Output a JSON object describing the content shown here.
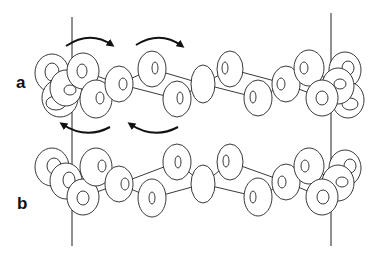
{
  "figure": {
    "panels": [
      {
        "label": "a",
        "label_pos": [
          16,
          74
        ],
        "rotation_arrows": [
          {
            "from": [
              66,
              46
            ],
            "ctrl": [
              90,
              30
            ],
            "to": [
              112,
              45
            ],
            "direction": "clockwise-right"
          },
          {
            "from": [
              136,
              45
            ],
            "ctrl": [
              160,
              30
            ],
            "to": [
              182,
              46
            ],
            "direction": "clockwise-right"
          },
          {
            "from": [
              110,
              127
            ],
            "ctrl": [
              86,
              140
            ],
            "to": [
              62,
              124
            ],
            "direction": "counter-left"
          },
          {
            "from": [
              178,
              127
            ],
            "ctrl": [
              154,
              140
            ],
            "to": [
              130,
              124
            ],
            "direction": "counter-left"
          }
        ],
        "rings": [
          {
            "cx": 52,
            "cy": 73,
            "rx": 17,
            "ry": 19,
            "hx": 52,
            "hy": 72,
            "hrx": 7,
            "hry": 9
          },
          {
            "cx": 60,
            "cy": 98,
            "rx": 18,
            "ry": 19,
            "hx": 56,
            "hy": 103,
            "hrx": 10,
            "hry": 7
          },
          {
            "cx": 66,
            "cy": 88,
            "rx": 16,
            "ry": 18,
            "hx": 70,
            "hy": 90,
            "hrx": 6,
            "hry": 5
          },
          {
            "cx": 83,
            "cy": 71,
            "rx": 16,
            "ry": 18,
            "hx": 82,
            "hy": 71,
            "hrx": 5,
            "hry": 7
          },
          {
            "cx": 96,
            "cy": 99,
            "rx": 16,
            "ry": 19,
            "hx": 100,
            "hy": 98,
            "hrx": 4,
            "hry": 6
          },
          {
            "cx": 119,
            "cy": 84,
            "rx": 14,
            "ry": 18,
            "hx": 123,
            "hy": 84,
            "hrx": 4,
            "hry": 6
          },
          {
            "cx": 152,
            "cy": 69,
            "rx": 14,
            "ry": 18,
            "hx": 155,
            "hy": 68,
            "hrx": 3,
            "hry": 6
          },
          {
            "cx": 177,
            "cy": 99,
            "rx": 14,
            "ry": 18,
            "hx": 180,
            "hy": 98,
            "hrx": 3,
            "hry": 6
          },
          {
            "cx": 203,
            "cy": 84,
            "rx": 12,
            "ry": 19,
            "hx": 0,
            "hy": 0,
            "hrx": 0,
            "hry": 0
          },
          {
            "cx": 230,
            "cy": 69,
            "rx": 13,
            "ry": 18,
            "hx": 225,
            "hy": 68,
            "hrx": 3,
            "hry": 6
          },
          {
            "cx": 258,
            "cy": 98,
            "rx": 14,
            "ry": 18,
            "hx": 253,
            "hy": 97,
            "hrx": 3,
            "hry": 6
          },
          {
            "cx": 286,
            "cy": 84,
            "rx": 14,
            "ry": 18,
            "hx": 281,
            "hy": 84,
            "hrx": 4,
            "hry": 6
          },
          {
            "cx": 309,
            "cy": 68,
            "rx": 15,
            "ry": 18,
            "hx": 304,
            "hy": 68,
            "hrx": 4,
            "hry": 6
          },
          {
            "cx": 345,
            "cy": 70,
            "rx": 16,
            "ry": 18,
            "hx": 348,
            "hy": 68,
            "hrx": 6,
            "hry": 7
          },
          {
            "cx": 348,
            "cy": 100,
            "rx": 16,
            "ry": 18,
            "hx": 350,
            "hy": 104,
            "hrx": 8,
            "hry": 6
          },
          {
            "cx": 338,
            "cy": 86,
            "rx": 16,
            "ry": 18,
            "hx": 340,
            "hy": 84,
            "hrx": 6,
            "hry": 5
          },
          {
            "cx": 322,
            "cy": 98,
            "rx": 16,
            "ry": 18,
            "hx": 322,
            "hy": 98,
            "hrx": 6,
            "hry": 7
          }
        ],
        "bonds": [
          [
            [
              83,
              71
            ],
            [
              119,
              84
            ]
          ],
          [
            [
              96,
              99
            ],
            [
              119,
              84
            ]
          ],
          [
            [
              119,
              84
            ],
            [
              152,
              69
            ]
          ],
          [
            [
              152,
              69
            ],
            [
              203,
              84
            ]
          ],
          [
            [
              177,
              99
            ],
            [
              203,
              84
            ]
          ],
          [
            [
              119,
              84
            ],
            [
              177,
              99
            ]
          ],
          [
            [
              203,
              84
            ],
            [
              230,
              69
            ]
          ],
          [
            [
              203,
              84
            ],
            [
              258,
              98
            ]
          ],
          [
            [
              230,
              69
            ],
            [
              286,
              84
            ]
          ],
          [
            [
              258,
              98
            ],
            [
              286,
              84
            ]
          ],
          [
            [
              286,
              84
            ],
            [
              309,
              68
            ]
          ],
          [
            [
              286,
              84
            ],
            [
              322,
              98
            ]
          ],
          [
            [
              322,
              98
            ],
            [
              338,
              86
            ]
          ],
          [
            [
              309,
              68
            ],
            [
              338,
              86
            ]
          ]
        ]
      },
      {
        "label": "b",
        "label_pos": [
          17,
          195
        ],
        "rotation_arrows": [],
        "rings": [
          {
            "cx": 52,
            "cy": 167,
            "rx": 17,
            "ry": 19,
            "hx": 54,
            "hy": 166,
            "hrx": 7,
            "hry": 8
          },
          {
            "cx": 66,
            "cy": 181,
            "rx": 16,
            "ry": 18,
            "hx": 69,
            "hy": 180,
            "hrx": 6,
            "hry": 8
          },
          {
            "cx": 83,
            "cy": 197,
            "rx": 16,
            "ry": 18,
            "hx": 83,
            "hy": 198,
            "hrx": 6,
            "hry": 7
          },
          {
            "cx": 96,
            "cy": 167,
            "rx": 16,
            "ry": 19,
            "hx": 102,
            "hy": 166,
            "hrx": 4,
            "hry": 6
          },
          {
            "cx": 119,
            "cy": 184,
            "rx": 14,
            "ry": 18,
            "hx": 125,
            "hy": 184,
            "hrx": 4,
            "hry": 6
          },
          {
            "cx": 177,
            "cy": 162,
            "rx": 14,
            "ry": 18,
            "hx": 178,
            "hy": 162,
            "hrx": 3,
            "hry": 6
          },
          {
            "cx": 152,
            "cy": 198,
            "rx": 14,
            "ry": 19,
            "hx": 152,
            "hy": 198,
            "hrx": 3,
            "hry": 6
          },
          {
            "cx": 203,
            "cy": 184,
            "rx": 12,
            "ry": 19,
            "hx": 0,
            "hy": 0,
            "hrx": 0,
            "hry": 0
          },
          {
            "cx": 230,
            "cy": 162,
            "rx": 13,
            "ry": 18,
            "hx": 226,
            "hy": 161,
            "hrx": 3,
            "hry": 6
          },
          {
            "cx": 258,
            "cy": 197,
            "rx": 14,
            "ry": 19,
            "hx": 253,
            "hy": 197,
            "hrx": 3,
            "hry": 6
          },
          {
            "cx": 286,
            "cy": 182,
            "rx": 14,
            "ry": 18,
            "hx": 282,
            "hy": 182,
            "hrx": 4,
            "hry": 6
          },
          {
            "cx": 309,
            "cy": 166,
            "rx": 15,
            "ry": 18,
            "hx": 305,
            "hy": 166,
            "hrx": 4,
            "hry": 6
          },
          {
            "cx": 345,
            "cy": 168,
            "rx": 16,
            "ry": 18,
            "hx": 350,
            "hy": 166,
            "hrx": 6,
            "hry": 7
          },
          {
            "cx": 338,
            "cy": 183,
            "rx": 16,
            "ry": 18,
            "hx": 342,
            "hy": 182,
            "hrx": 6,
            "hry": 5
          },
          {
            "cx": 322,
            "cy": 197,
            "rx": 16,
            "ry": 18,
            "hx": 323,
            "hy": 197,
            "hrx": 6,
            "hry": 7
          }
        ],
        "bonds": [
          [
            [
              66,
              181
            ],
            [
              96,
              167
            ]
          ],
          [
            [
              83,
              197
            ],
            [
              119,
              184
            ]
          ],
          [
            [
              96,
              167
            ],
            [
              119,
              184
            ]
          ],
          [
            [
              119,
              184
            ],
            [
              177,
              162
            ]
          ],
          [
            [
              119,
              184
            ],
            [
              152,
              198
            ]
          ],
          [
            [
              177,
              162
            ],
            [
              203,
              184
            ]
          ],
          [
            [
              152,
              198
            ],
            [
              203,
              184
            ]
          ],
          [
            [
              203,
              184
            ],
            [
              230,
              162
            ]
          ],
          [
            [
              203,
              184
            ],
            [
              258,
              197
            ]
          ],
          [
            [
              230,
              162
            ],
            [
              286,
              182
            ]
          ],
          [
            [
              258,
              197
            ],
            [
              286,
              182
            ]
          ],
          [
            [
              286,
              182
            ],
            [
              309,
              166
            ]
          ],
          [
            [
              286,
              182
            ],
            [
              322,
              197
            ]
          ],
          [
            [
              309,
              166
            ],
            [
              338,
              183
            ]
          ],
          [
            [
              322,
              197
            ],
            [
              338,
              183
            ]
          ]
        ]
      }
    ],
    "vertical_lines": [
      {
        "x": 72,
        "y1": 17,
        "y2": 246
      },
      {
        "x": 331,
        "y1": 13,
        "y2": 246
      }
    ],
    "colors": {
      "stroke": "#222222",
      "fill": "#ffffff",
      "text": "#111111"
    }
  }
}
